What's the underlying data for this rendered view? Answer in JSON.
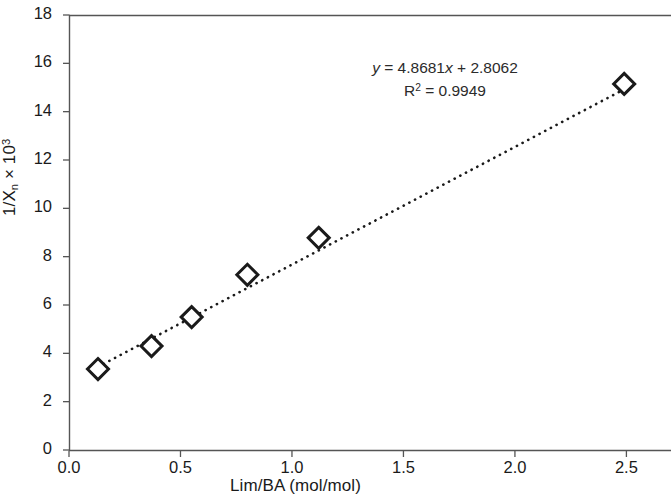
{
  "chart_data": {
    "type": "scatter",
    "title": "",
    "subtitle": "",
    "xlabel": "Lim/BA (mol/mol)",
    "ylabel_parts": {
      "prefix": "1/X",
      "sub": "n",
      "mid": " × 10",
      "sup": "3"
    },
    "ylabel": "1/Xn × 10³",
    "xlim": [
      0.0,
      2.7
    ],
    "ylim": [
      0,
      18
    ],
    "xticks": [
      0.0,
      0.5,
      1.0,
      1.5,
      2.0,
      2.5
    ],
    "xtick_labels": [
      "0.0",
      "0.5",
      "1.0",
      "1.5",
      "2.0",
      "2.5"
    ],
    "yticks": [
      0,
      2,
      4,
      6,
      8,
      10,
      12,
      14,
      16,
      18
    ],
    "ytick_labels": [
      "0",
      "2",
      "4",
      "6",
      "8",
      "10",
      "12",
      "14",
      "16",
      "18"
    ],
    "grid": false,
    "legend": false,
    "legend_position": "none",
    "marker": "open-diamond",
    "marker_color": "#1a1a1a",
    "trendline_style": "dotted",
    "trendline_color": "#1a1a1a",
    "series": [
      {
        "name": "1/Xn vs Lim/BA",
        "x": [
          0.13,
          0.37,
          0.55,
          0.8,
          1.12,
          2.49
        ],
        "values": [
          3.35,
          4.3,
          5.5,
          7.25,
          8.78,
          15.15
        ]
      }
    ],
    "annotations": {
      "equation": "y = 4.8681x + 2.8062",
      "equation_lhs": "y",
      "equation_rhs_slope": "4.8681",
      "equation_rhs_intercept": "2.8062",
      "r_squared_label": "R",
      "r_squared_exponent": "2",
      "r_squared_value": "0.9949",
      "r_squared": "R² = 0.9949"
    },
    "fit": {
      "slope": 4.8681,
      "intercept": 2.8062,
      "r_squared": 0.9949,
      "x_start": 0.13,
      "x_end": 2.52
    }
  },
  "colors": {
    "axis": "#555555",
    "text": "#1a1a1a",
    "annotation_text": "#2b2b2b",
    "marker": "#1a1a1a",
    "background": "#ffffff"
  }
}
